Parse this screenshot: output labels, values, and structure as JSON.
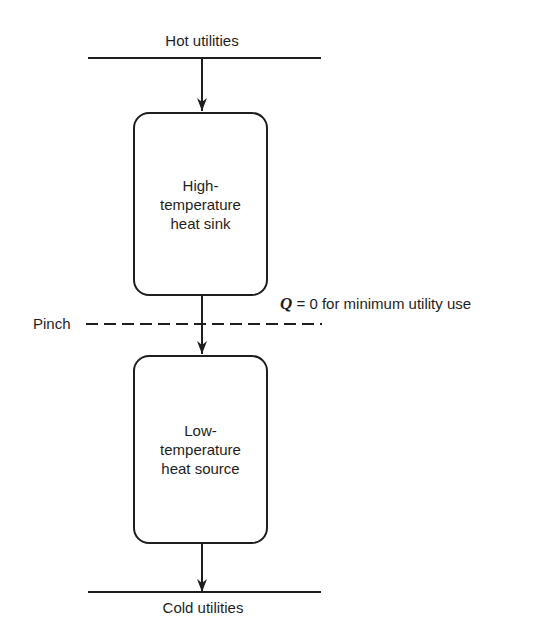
{
  "diagram": {
    "type": "pinch-decomposition",
    "hot_utilities": {
      "label": "Hot utilities"
    },
    "cold_utilities": {
      "label": "Cold utilities"
    },
    "pinch": {
      "label": "Pinch",
      "annotation": {
        "variable": "Q",
        "text": " = 0 for minimum utility use"
      }
    },
    "blocks": [
      {
        "id": "high",
        "lines": [
          "High-",
          "temperature",
          "heat sink"
        ]
      },
      {
        "id": "low",
        "lines": [
          "Low-",
          "temperature",
          "heat source"
        ]
      }
    ],
    "arrows": [
      {
        "from": "hot_utilities",
        "to": "high"
      },
      {
        "from": "high",
        "to": "low",
        "crosses": "pinch"
      },
      {
        "from": "low",
        "to": "cold_utilities"
      }
    ],
    "colors": {
      "line": "#1e1e1e",
      "background": "#ffffff"
    }
  }
}
